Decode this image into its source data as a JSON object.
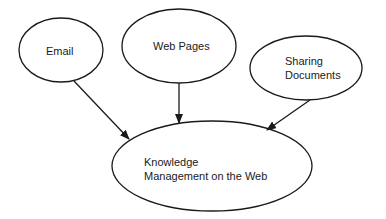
{
  "diagram": {
    "type": "concept-map",
    "nodes": [
      {
        "id": "email",
        "label_lines": [
          "Email"
        ]
      },
      {
        "id": "web-pages",
        "label_lines": [
          "Web Pages"
        ]
      },
      {
        "id": "sharing-documents",
        "label_lines": [
          "Sharing",
          "Documents"
        ]
      },
      {
        "id": "knowledge-management",
        "label_lines": [
          "Knowledge",
          "Management on the Web"
        ]
      }
    ],
    "edges": [
      {
        "from": "email",
        "to": "knowledge-management"
      },
      {
        "from": "web-pages",
        "to": "knowledge-management"
      },
      {
        "from": "sharing-documents",
        "to": "knowledge-management"
      }
    ],
    "stroke_color": "#1a1a1a"
  }
}
